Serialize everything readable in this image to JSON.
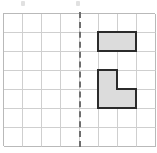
{
  "figure": {
    "name": "symmetry-grid-worksheet",
    "background_color": "#ffffff"
  },
  "grid": {
    "columns": 8,
    "rows": 7,
    "cell_size_px": 19,
    "origin_x_px": 3,
    "origin_y_px": 13,
    "line_color": "#cfcfcf",
    "border_color": "#b9b9b9"
  },
  "mirror_line": {
    "label": "line-of-symmetry",
    "orientation": "vertical",
    "at_column": 4,
    "style": "dashed",
    "color": "#6e6e6e",
    "width_px": 2
  },
  "shapes": [
    {
      "name": "domino-horizontal",
      "cells": [
        {
          "col": 5,
          "row": 1
        },
        {
          "col": 6,
          "row": 1
        }
      ],
      "fill": "#dcdcdc",
      "outline": "#2b2b2b"
    },
    {
      "name": "l-tromino",
      "cells": [
        {
          "col": 5,
          "row": 3
        },
        {
          "col": 5,
          "row": 4
        },
        {
          "col": 6,
          "row": 4
        }
      ],
      "fill": "#dcdcdc",
      "outline": "#2b2b2b"
    }
  ],
  "crop_remnants": [
    {
      "name": "crop-remnant-left",
      "x": 21,
      "y": 1
    },
    {
      "name": "crop-remnant-right",
      "x": 76,
      "y": 1
    }
  ]
}
